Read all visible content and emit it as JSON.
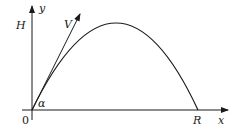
{
  "diagram": {
    "labels": {
      "y_axis": "y",
      "x_axis": "x",
      "max_height": "H",
      "velocity": "V",
      "angle": "α",
      "origin": "0",
      "range": "R"
    },
    "colors": {
      "stroke": "#1a1a1a",
      "background": "#ffffff"
    }
  }
}
